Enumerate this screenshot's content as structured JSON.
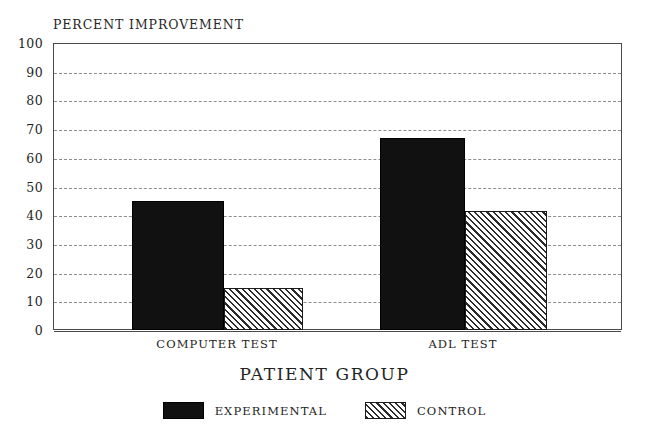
{
  "chart_data": {
    "type": "bar",
    "title": "",
    "ylabel": "PERCENT IMPROVEMENT",
    "xlabel": "PATIENT GROUP",
    "categories": [
      "COMPUTER TEST",
      "ADL TEST"
    ],
    "series": [
      {
        "name": "EXPERIMENTAL",
        "values": [
          45,
          67
        ],
        "fill": "solid-black",
        "color": "#111111"
      },
      {
        "name": "CONTROL",
        "values": [
          14.5,
          41.5
        ],
        "fill": "diagonal-hatch",
        "color": "#2b2b2b"
      }
    ],
    "ylim": [
      0,
      100
    ],
    "ytick_labels": [
      "100",
      "90",
      "80",
      "70",
      "60",
      "50",
      "40",
      "30",
      "20",
      "10",
      "0"
    ],
    "ytick_values": [
      100,
      90,
      80,
      70,
      60,
      50,
      40,
      30,
      20,
      10,
      0
    ],
    "grid": true,
    "grid_style": "dashed-horizontal",
    "legend_position": "bottom-center",
    "background": "#ffffff"
  },
  "legend": {
    "items": [
      {
        "label": "EXPERIMENTAL"
      },
      {
        "label": "CONTROL"
      }
    ]
  }
}
